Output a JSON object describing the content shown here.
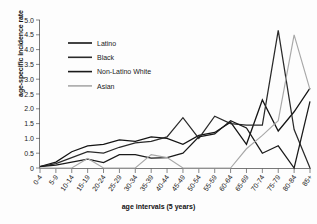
{
  "chart_data": {
    "type": "line",
    "title": "",
    "xlabel": "age intervals (5 years)",
    "ylabel": "age-specific incidence rate",
    "ylim": [
      0,
      5.0
    ],
    "yticks": [
      "0",
      "0.5",
      "1.0",
      "1.5",
      "2.0",
      "2.5",
      "3.0",
      "3.5",
      "4.0",
      "4.5",
      "5.0"
    ],
    "grid": false,
    "legend_position": "upper-left-inside",
    "categories": [
      "0-4",
      "5-9",
      "10-14",
      "15-19",
      "20-24",
      "25-29",
      "30-34",
      "35-39",
      "40-44",
      "45-49",
      "50-54",
      "55-59",
      "60-64",
      "65-69",
      "70-74",
      "75-79",
      "80-84",
      "85+"
    ],
    "series": [
      {
        "name": "Latino",
        "color": "#141414",
        "values": [
          0.05,
          0.2,
          0.55,
          0.75,
          0.8,
          0.95,
          0.9,
          1.05,
          1.0,
          0.8,
          1.1,
          1.2,
          1.55,
          0.8,
          2.3,
          1.25,
          1.9,
          2.7
        ]
      },
      {
        "name": "Black",
        "color": "#2a2a2a",
        "values": [
          0.05,
          0.15,
          0.35,
          0.55,
          0.5,
          0.7,
          0.85,
          0.9,
          1.05,
          1.7,
          1.0,
          1.75,
          1.5,
          1.45,
          1.45,
          4.65,
          1.3,
          0.0
        ]
      },
      {
        "name": "Non-Latino White",
        "color": "#1a1a1a",
        "values": [
          0.05,
          0.1,
          0.2,
          0.3,
          0.18,
          0.45,
          0.45,
          0.33,
          0.35,
          0.5,
          1.05,
          1.15,
          1.6,
          1.35,
          0.5,
          0.75,
          0.0,
          2.25
        ]
      },
      {
        "name": "Asian",
        "color": "#a8a8a8",
        "values": [
          0.0,
          0.0,
          0.0,
          0.32,
          0.0,
          0.0,
          0.0,
          0.45,
          0.35,
          0.0,
          0.0,
          0.0,
          0.0,
          0.65,
          1.1,
          1.6,
          4.5,
          2.65
        ]
      }
    ]
  },
  "legend": {
    "items": [
      {
        "label": "Latino"
      },
      {
        "label": "Black"
      },
      {
        "label": "Non-Latino White"
      },
      {
        "label": "Asian"
      }
    ]
  }
}
